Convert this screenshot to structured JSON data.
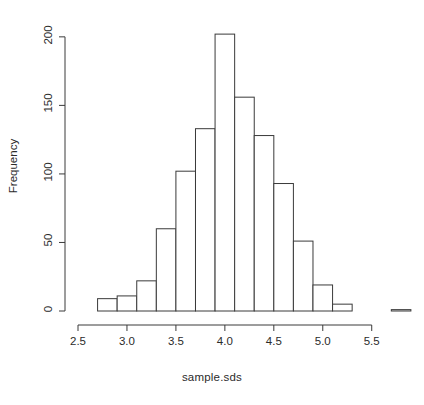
{
  "figure": {
    "title_visible_fragment": "",
    "background_color": "#ffffff",
    "foreground_color": "#000000"
  },
  "chart_data": {
    "type": "bar",
    "subtype": "histogram",
    "xlabel": "sample.sds",
    "ylabel": "Frequency",
    "xlim": [
      2.5,
      5.85
    ],
    "ylim": [
      0,
      205
    ],
    "grid": false,
    "legend": null,
    "bin_width": 0.2,
    "bin_edges": [
      2.7,
      2.9,
      3.1,
      3.3,
      3.5,
      3.7,
      3.9,
      4.1,
      4.3,
      4.5,
      4.7,
      4.9,
      5.1,
      5.3
    ],
    "categories": [
      "2.7-2.9",
      "2.9-3.1",
      "3.1-3.3",
      "3.3-3.5",
      "3.5-3.7",
      "3.7-3.9",
      "3.9-4.1",
      "4.1-4.3",
      "4.3-4.5",
      "4.5-4.7",
      "4.7-4.9",
      "4.9-5.1",
      "5.1-5.3"
    ],
    "values": [
      9,
      11,
      22,
      60,
      102,
      133,
      202,
      156,
      128,
      93,
      51,
      19,
      5
    ],
    "outlier_bins": [
      {
        "range": "5.7-5.9",
        "center": 5.8,
        "value": 1
      }
    ],
    "bars": [
      {
        "x0": 2.7,
        "x1": 2.9,
        "height": 9
      },
      {
        "x0": 2.9,
        "x1": 3.1,
        "height": 11
      },
      {
        "x0": 3.1,
        "x1": 3.3,
        "height": 22
      },
      {
        "x0": 3.3,
        "x1": 3.5,
        "height": 60
      },
      {
        "x0": 3.5,
        "x1": 3.7,
        "height": 102
      },
      {
        "x0": 3.7,
        "x1": 3.9,
        "height": 133
      },
      {
        "x0": 3.9,
        "x1": 4.1,
        "height": 202
      },
      {
        "x0": 4.1,
        "x1": 4.3,
        "height": 156
      },
      {
        "x0": 4.3,
        "x1": 4.5,
        "height": 128
      },
      {
        "x0": 4.5,
        "x1": 4.7,
        "height": 93
      },
      {
        "x0": 4.7,
        "x1": 4.9,
        "height": 51
      },
      {
        "x0": 4.9,
        "x1": 5.1,
        "height": 19
      },
      {
        "x0": 5.1,
        "x1": 5.3,
        "height": 5
      },
      {
        "x0": 5.7,
        "x1": 5.9,
        "height": 1
      }
    ]
  },
  "axes": {
    "x": {
      "label": "sample.sds",
      "ticks": [
        {
          "value": 2.5,
          "label": "2.5"
        },
        {
          "value": 3.0,
          "label": "3.0"
        },
        {
          "value": 3.5,
          "label": "3.5"
        },
        {
          "value": 4.0,
          "label": "4.0"
        },
        {
          "value": 4.5,
          "label": "4.5"
        },
        {
          "value": 5.0,
          "label": "5.0"
        },
        {
          "value": 5.5,
          "label": "5.5"
        }
      ]
    },
    "y": {
      "label": "Frequency",
      "ticks": [
        {
          "value": 0,
          "label": "0"
        },
        {
          "value": 50,
          "label": "50"
        },
        {
          "value": 100,
          "label": "100"
        },
        {
          "value": 150,
          "label": "150"
        },
        {
          "value": 200,
          "label": "200"
        }
      ]
    }
  },
  "style": {
    "bar_fill": "#ffffff",
    "bar_stroke": "#3a3a3a",
    "axis_stroke": "#3a3a3a",
    "text_color": "#2b2b2b"
  }
}
